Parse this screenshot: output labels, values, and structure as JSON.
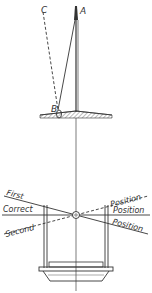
{
  "diagram": {
    "points": {
      "A": "A",
      "B": "B",
      "C": "C"
    },
    "left_labels": [
      "First",
      "Correct",
      "Second"
    ],
    "right_labels": [
      "Position",
      "Position",
      "Position"
    ],
    "colors": {
      "ink": "#333333",
      "background": "#ffffff"
    }
  }
}
